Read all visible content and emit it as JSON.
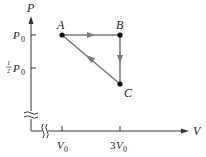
{
  "diagram": {
    "type": "pv-diagram",
    "axes": {
      "y_label": "P",
      "x_label": "V",
      "y_ticks": [
        {
          "label_frac_num": "1",
          "label_frac_den": "2",
          "label": "P",
          "sub": "0",
          "level": "half"
        },
        {
          "label": "P",
          "sub": "0",
          "level": "full"
        }
      ],
      "x_ticks": [
        {
          "label": "V",
          "sub": "0",
          "coef": ""
        },
        {
          "label": "V",
          "sub": "0",
          "coef": "3"
        }
      ],
      "y_axis_break": true,
      "x_axis_break": true
    },
    "points": [
      {
        "name": "A",
        "V": "V0",
        "P": "P0"
      },
      {
        "name": "B",
        "V": "3V0",
        "P": "P0"
      },
      {
        "name": "C",
        "V": "3V0",
        "P": "1/2 P0"
      }
    ],
    "paths": [
      {
        "from": "A",
        "to": "B",
        "direction": "right"
      },
      {
        "from": "B",
        "to": "C",
        "direction": "down"
      },
      {
        "from": "C",
        "to": "A",
        "direction": "up-left"
      }
    ],
    "colors": {
      "axis": "#333333",
      "path": "#7a7a7a",
      "point": "#111111",
      "text": "#1a1a1a"
    }
  }
}
